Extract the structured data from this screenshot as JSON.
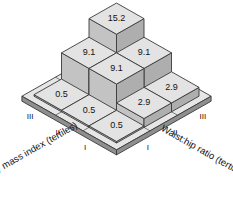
{
  "chart_data": {
    "type": "bar",
    "title": "",
    "subtitle": "",
    "projection": "isometric-3d",
    "xlabel": "Waist:hip ratio (tertiles)",
    "ylabel": "Body mass index (tertiles)",
    "zlabel": "",
    "x_categories": [
      "I",
      "II",
      "III"
    ],
    "y_categories": [
      "I",
      "II",
      "III"
    ],
    "grid": false,
    "legend": null,
    "zlim": [
      0,
      15.2
    ],
    "bar_color_top": "#e3e3e3",
    "bar_color_left": "#c3c3c3",
    "bar_color_right": "#aeaeae",
    "plate_color_top": "#e6e6e6",
    "plate_color_side": "#8f8f8f",
    "outline_color": "#3a3a3a",
    "cells": [
      {
        "bmi": "I",
        "whr": "I",
        "value": 0.5,
        "label": "0.5"
      },
      {
        "bmi": "I",
        "whr": "II",
        "value": 2.9,
        "label": "2.9"
      },
      {
        "bmi": "I",
        "whr": "III",
        "value": 2.9,
        "label": "2.9"
      },
      {
        "bmi": "II",
        "whr": "I",
        "value": 0.5,
        "label": "0.5"
      },
      {
        "bmi": "II",
        "whr": "II",
        "value": 9.1,
        "label": "9.1"
      },
      {
        "bmi": "II",
        "whr": "III",
        "value": 9.1,
        "label": "9.1"
      },
      {
        "bmi": "III",
        "whr": "I",
        "value": 0.5,
        "label": "0.5"
      },
      {
        "bmi": "III",
        "whr": "II",
        "value": 9.1,
        "label": "9.1"
      },
      {
        "bmi": "III",
        "whr": "III",
        "value": 15.2,
        "label": "15.2"
      }
    ],
    "values_matrix": [
      [
        0.5,
        2.9,
        2.9
      ],
      [
        0.5,
        9.1,
        9.1
      ],
      [
        0.5,
        9.1,
        15.2
      ]
    ],
    "value_labels_flat": [
      "15.2",
      "9.1",
      "9.1",
      "9.1",
      "0.5",
      "0.5",
      "0.5",
      "2.9",
      "2.9"
    ]
  },
  "axes": {
    "left": {
      "title": "Body mass index (tertiles)",
      "ticks": [
        "III",
        "II",
        "I"
      ]
    },
    "right": {
      "title": "Waist:hip ratio (tertiles)",
      "ticks": [
        "I",
        "II",
        "III"
      ]
    }
  }
}
